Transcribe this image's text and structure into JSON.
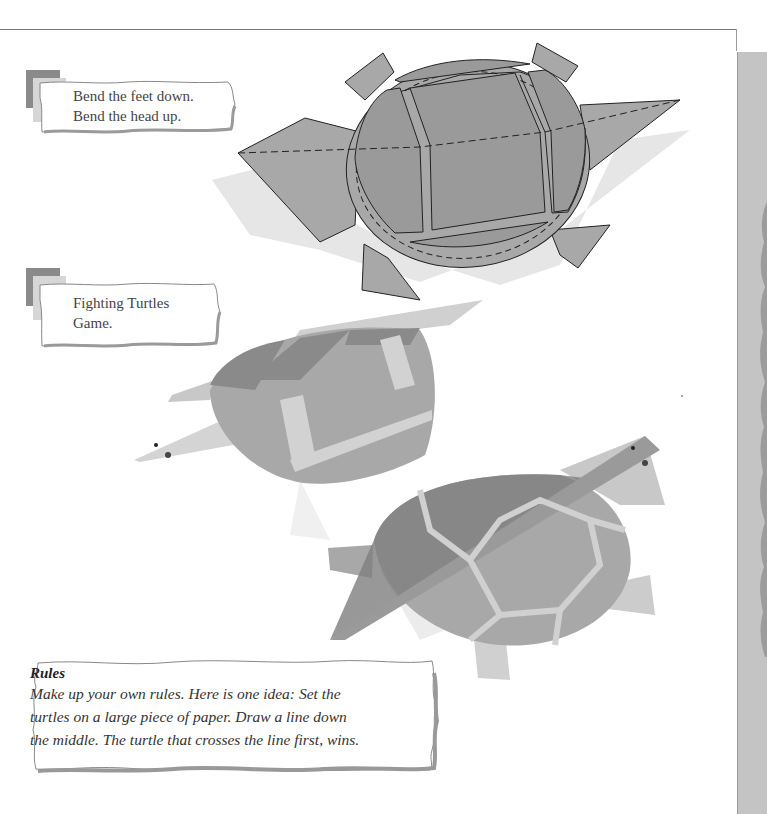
{
  "steps": [
    {
      "number": "3",
      "lines": [
        "Bend the feet down.",
        "Bend the head up."
      ]
    },
    {
      "number": "4",
      "lines": [
        "Fighting Turtles",
        "Game."
      ]
    }
  ],
  "rules": {
    "title": "Rules",
    "lines": [
      "Make up your own rules. Here is one idea: Set the",
      "turtles on a large piece of paper. Draw a line down",
      "the middle. The turtle that crosses the line first, wins."
    ]
  },
  "colors": {
    "shell_gray": "#a8a8a8",
    "dark_gray": "#8c8c8c",
    "light_gray": "#d2d2d2",
    "outline": "#222222",
    "side_strip": "#c4c4c4"
  }
}
